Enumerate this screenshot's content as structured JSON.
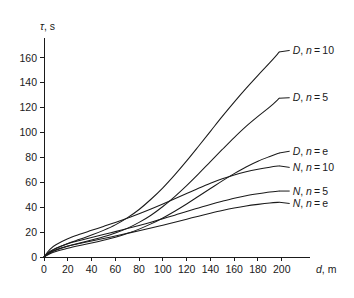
{
  "chart_data": {
    "type": "line",
    "title": "",
    "subtitle": "",
    "xlabel": "d, m",
    "ylabel": "τ, s",
    "xlabel_symbol": "d",
    "xlabel_unit": ", m",
    "ylabel_symbol": "τ",
    "ylabel_unit": ", s",
    "xlim": [
      0,
      212
    ],
    "ylim": [
      0,
      176
    ],
    "xticks": [
      0,
      20,
      40,
      60,
      80,
      100,
      120,
      140,
      160,
      180,
      200
    ],
    "yticks": [
      0,
      20,
      40,
      60,
      80,
      100,
      120,
      140,
      160
    ],
    "xtick_labels": [
      "0",
      "20",
      "40",
      "60",
      "80",
      "100",
      "120",
      "140",
      "160",
      "180",
      "200"
    ],
    "ytick_labels": [
      "0",
      "20",
      "40",
      "60",
      "80",
      "100",
      "120",
      "140",
      "160"
    ],
    "grid": false,
    "legend_position": "inline-right-endpoint-labels",
    "line_color": "#1a1a1a",
    "background_color": "#ffffff",
    "x": [
      0,
      5,
      10,
      20,
      30,
      40,
      50,
      60,
      70,
      80,
      90,
      100,
      110,
      120,
      130,
      140,
      150,
      160,
      170,
      180,
      190,
      198
    ],
    "series": [
      {
        "name": "D, n = 10",
        "label_prefix": "D",
        "label_middle": ", n = ",
        "label_value": "10",
        "label_x": 205,
        "label_y": 166,
        "values": [
          0,
          4.0,
          6.8,
          10.8,
          14.2,
          17.6,
          21.4,
          25.8,
          31.4,
          38.2,
          46.4,
          55.6,
          66.0,
          77.2,
          89.0,
          101.0,
          113.0,
          124.5,
          135.5,
          146.0,
          156.2,
          164.8
        ]
      },
      {
        "name": "D, n = 5",
        "label_prefix": "D",
        "label_middle": ", n = ",
        "label_value": "5",
        "label_x": 205,
        "label_y": 128,
        "values": [
          0,
          3.2,
          5.4,
          8.6,
          11.2,
          13.6,
          16.2,
          19.2,
          23.0,
          27.8,
          33.6,
          40.6,
          48.6,
          57.4,
          66.8,
          76.6,
          86.4,
          96.0,
          105.0,
          113.0,
          120.6,
          127.6
        ]
      },
      {
        "name": "D, n = e",
        "label_prefix": "D",
        "label_middle": ", n = ",
        "label_value": "e",
        "label_x": 205,
        "label_y": 85,
        "values": [
          0,
          2.6,
          4.4,
          7.0,
          9.2,
          11.2,
          13.4,
          15.8,
          18.8,
          22.4,
          26.6,
          31.4,
          36.8,
          42.6,
          48.8,
          55.0,
          61.2,
          67.0,
          72.4,
          77.0,
          80.8,
          83.6
        ]
      },
      {
        "name": "N, n = 10",
        "label_prefix": "N",
        "label_middle": ", n = ",
        "label_value": "10",
        "label_x": 205,
        "label_y": 72,
        "values": [
          0,
          6.2,
          9.8,
          14.6,
          18.2,
          21.4,
          24.6,
          27.8,
          31.2,
          34.8,
          38.6,
          42.6,
          46.8,
          51.0,
          55.2,
          59.2,
          62.8,
          66.0,
          68.6,
          70.6,
          72.2,
          73.2
        ]
      },
      {
        "name": "N, n = 5",
        "label_prefix": "N",
        "label_middle": ", n = ",
        "label_value": "5",
        "label_x": 205,
        "label_y": 53,
        "values": [
          0,
          4.4,
          7.0,
          10.6,
          13.2,
          15.6,
          18.0,
          20.4,
          22.9,
          25.4,
          28.0,
          30.8,
          33.6,
          36.6,
          39.4,
          42.2,
          44.8,
          47.2,
          49.2,
          50.8,
          52.2,
          53.0
        ]
      },
      {
        "name": "N, n = e",
        "label_prefix": "N",
        "label_middle": ", n = ",
        "label_value": "e",
        "label_x": 205,
        "label_y": 43,
        "values": [
          0,
          3.6,
          5.8,
          8.8,
          10.9,
          12.9,
          14.9,
          16.9,
          19.0,
          21.1,
          23.3,
          25.6,
          28.0,
          30.4,
          32.8,
          35.1,
          37.3,
          39.3,
          41.0,
          42.3,
          43.4,
          44.0
        ]
      }
    ]
  }
}
